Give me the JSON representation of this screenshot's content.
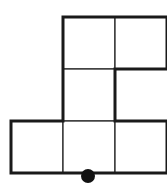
{
  "diagram": {
    "type": "grid-polyomino",
    "cell_size": 52,
    "origin": {
      "x": 11,
      "y": 17
    },
    "cells": [
      {
        "row": 0,
        "col": 1
      },
      {
        "row": 0,
        "col": 2
      },
      {
        "row": 1,
        "col": 1
      },
      {
        "row": 2,
        "col": 0
      },
      {
        "row": 2,
        "col": 1
      },
      {
        "row": 2,
        "col": 2
      }
    ],
    "outline_color": "#1a1a1a",
    "inner_line_color": "#2a2a2a",
    "marker": {
      "shape": "dot",
      "x": 88,
      "y": 176,
      "r": 7,
      "color": "#111111"
    }
  }
}
